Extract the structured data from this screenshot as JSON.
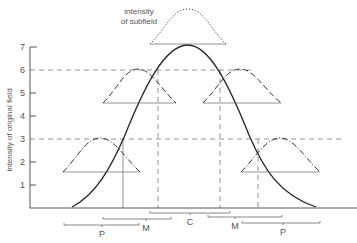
{
  "diagram": {
    "type": "field-intensity-diagram",
    "subfield_label_line1": "intensity",
    "subfield_label_line2": "of subfield",
    "y_axis_label": "intensity of original field",
    "y_ticks": [
      "1",
      "2",
      "3",
      "4",
      "5",
      "6",
      "7"
    ],
    "regions": {
      "center": "C",
      "middle_left": "M",
      "middle_right": "M",
      "periphery_left": "P",
      "periphery_right": "P"
    },
    "reference_levels": [
      6,
      3
    ],
    "colors": {
      "line": "#222222",
      "text": "#555555",
      "guide": "#666666"
    }
  }
}
